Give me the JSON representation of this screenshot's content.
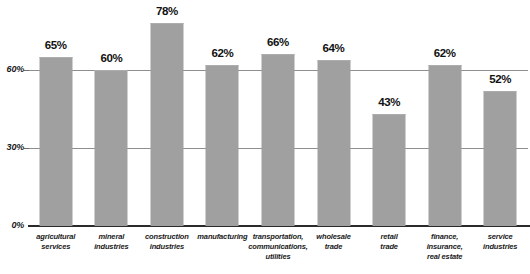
{
  "chart_data": {
    "type": "bar",
    "title": "",
    "subtitle": "",
    "xlabel": "",
    "ylabel": "",
    "ylim": [
      0,
      90
    ],
    "grid": true,
    "legend": null,
    "ytick_labels": [
      "0%",
      "30%",
      "60%"
    ],
    "ytick_values": [
      0,
      30,
      60
    ],
    "value_suffix": "%",
    "categories": [
      "agricultural\nservices",
      "mineral\nindustries",
      "construction\nindustries",
      "manufacturing",
      "transportation,\ncommunications,\nutilities",
      "wholesale\ntrade",
      "retail\ntrade",
      "finance,\ninsurance,\nreal estate",
      "service\nindustries"
    ],
    "values": [
      65,
      60,
      78,
      62,
      66,
      64,
      43,
      62,
      52
    ],
    "value_labels": [
      "65%",
      "60%",
      "78%",
      "62%",
      "66%",
      "64%",
      "43%",
      "62%",
      "52%"
    ],
    "colors": {
      "bar": "#a0a0a0",
      "gridline": "#8e8e8e",
      "baseline": "#2b2b2b",
      "text": "#111111",
      "background": "#ffffff"
    }
  }
}
